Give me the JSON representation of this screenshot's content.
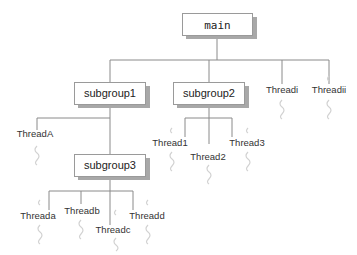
{
  "diagram": {
    "root": {
      "label": "main"
    },
    "groups": [
      {
        "label": "subgroup1",
        "parent": "main"
      },
      {
        "label": "subgroup2",
        "parent": "main"
      },
      {
        "label": "subgroup3",
        "parent": "subgroup1"
      }
    ],
    "threads": {
      "main": [
        "Threadi",
        "Threadii"
      ],
      "subgroup1": [
        "ThreadA"
      ],
      "subgroup2": [
        "Thread1",
        "Thread2",
        "Thread3"
      ],
      "subgroup3": [
        "Threada",
        "Threadb",
        "Threadc",
        "Threadd"
      ]
    },
    "labels": {
      "main": "main",
      "subgroup1": "subgroup1",
      "subgroup2": "subgroup2",
      "subgroup3": "subgroup3",
      "threadi": "Threadi",
      "threadii": "Threadii",
      "threadA": "ThreadA",
      "thread1": "Thread1",
      "thread2": "Thread2",
      "thread3": "Thread3",
      "threada": "Threada",
      "threadb": "Threadb",
      "threadc": "Threadc",
      "threadd": "Threadd"
    },
    "colors": {
      "line": "#8a8a8a",
      "box_border": "#9a9a9a",
      "shadow": "#a8a8a8",
      "squiggle": "#d2d2d2",
      "text": "#222222"
    }
  }
}
